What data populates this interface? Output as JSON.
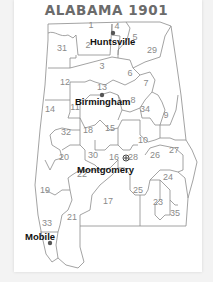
{
  "map": {
    "title": "ALABAMA 1901",
    "districts": [
      {
        "id": "1",
        "x": 91,
        "y": 28
      },
      {
        "id": "2",
        "x": 88,
        "y": 48
      },
      {
        "id": "3",
        "x": 102,
        "y": 69
      },
      {
        "id": "4",
        "x": 117,
        "y": 29
      },
      {
        "id": "5",
        "x": 135,
        "y": 40
      },
      {
        "id": "6",
        "x": 130,
        "y": 76
      },
      {
        "id": "7",
        "x": 146,
        "y": 86
      },
      {
        "id": "8",
        "x": 133,
        "y": 103
      },
      {
        "id": "9",
        "x": 166,
        "y": 118
      },
      {
        "id": "10",
        "x": 143,
        "y": 143
      },
      {
        "id": "11",
        "x": 75,
        "y": 110
      },
      {
        "id": "12",
        "x": 65,
        "y": 85
      },
      {
        "id": "13",
        "x": 102,
        "y": 90
      },
      {
        "id": "14",
        "x": 50,
        "y": 112
      },
      {
        "id": "15",
        "x": 110,
        "y": 131
      },
      {
        "id": "16",
        "x": 114,
        "y": 160
      },
      {
        "id": "17",
        "x": 108,
        "y": 204
      },
      {
        "id": "18",
        "x": 88,
        "y": 133
      },
      {
        "id": "19",
        "x": 45,
        "y": 193
      },
      {
        "id": "20",
        "x": 64,
        "y": 160
      },
      {
        "id": "21",
        "x": 72,
        "y": 220
      },
      {
        "id": "22",
        "x": 82,
        "y": 177
      },
      {
        "id": "23",
        "x": 158,
        "y": 205
      },
      {
        "id": "24",
        "x": 168,
        "y": 180
      },
      {
        "id": "25",
        "x": 138,
        "y": 193
      },
      {
        "id": "26",
        "x": 155,
        "y": 158
      },
      {
        "id": "27",
        "x": 174,
        "y": 153
      },
      {
        "id": "28",
        "x": 133,
        "y": 160
      },
      {
        "id": "29",
        "x": 152,
        "y": 53
      },
      {
        "id": "30",
        "x": 93,
        "y": 158
      },
      {
        "id": "31",
        "x": 62,
        "y": 51
      },
      {
        "id": "32",
        "x": 66,
        "y": 135
      },
      {
        "id": "33",
        "x": 47,
        "y": 226
      },
      {
        "id": "34",
        "x": 145,
        "y": 112
      },
      {
        "id": "35",
        "x": 175,
        "y": 216
      }
    ],
    "cities": [
      {
        "name": "Huntsville",
        "marker": "dot",
        "mx": 113,
        "my": 33,
        "lx": 90,
        "ly": 45
      },
      {
        "name": "Birmingham",
        "marker": "dot",
        "mx": 102,
        "my": 95,
        "lx": 75,
        "ly": 105
      },
      {
        "name": "Montgomery",
        "marker": "star",
        "mx": 126,
        "my": 158,
        "lx": 77,
        "ly": 173
      },
      {
        "name": "Mobile",
        "marker": "dot",
        "mx": 50,
        "my": 243,
        "lx": 25,
        "ly": 240
      }
    ]
  }
}
